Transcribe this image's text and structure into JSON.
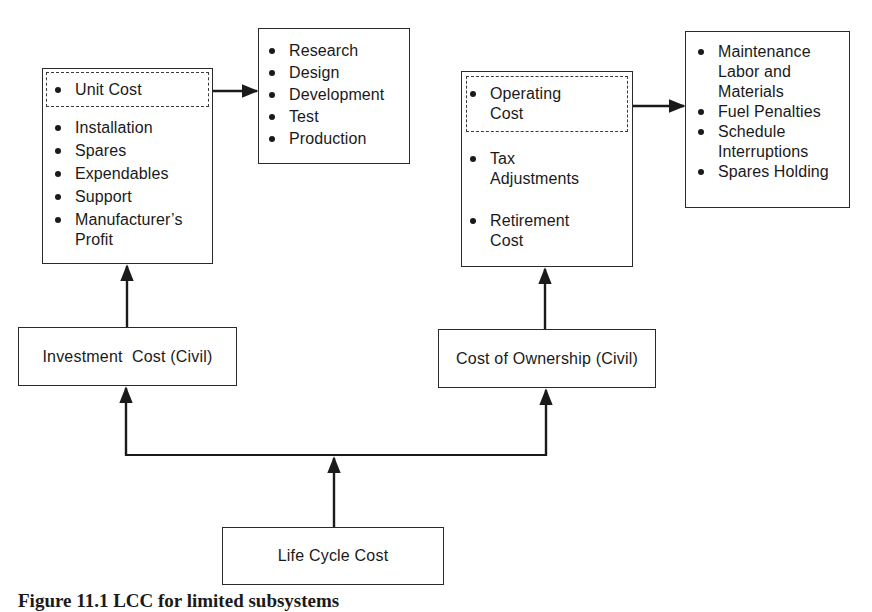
{
  "diagram": {
    "unit_box": {
      "highlighted_item": "Unit Cost",
      "items": [
        "Installation",
        "Spares",
        "Expendables",
        "Support",
        "Manufacturer’s\nProfit"
      ]
    },
    "rdte_box": {
      "items": [
        "Research",
        "Design",
        "Development",
        "Test",
        "Production"
      ]
    },
    "ownership_detail_box": {
      "highlighted_item": "Operating\nCost",
      "items": [
        "Tax\nAdjustments",
        "Retirement\nCost"
      ]
    },
    "operating_detail_box": {
      "items": [
        "Maintenance\nLabor  and\nMaterials",
        "Fuel Penalties",
        "Schedule\nInterruptions",
        "Spares Holding"
      ]
    },
    "investment_cost": {
      "label": "Investment  Cost (Civil)"
    },
    "cost_of_ownership": {
      "label": "Cost of Ownership (Civil)"
    },
    "life_cycle_cost": {
      "label": "Life Cycle Cost"
    },
    "edges": [
      {
        "from": "Life Cycle Cost",
        "to": "Investment  Cost (Civil)"
      },
      {
        "from": "Life Cycle Cost",
        "to": "Cost of Ownership (Civil)"
      },
      {
        "from": "Investment  Cost (Civil)",
        "to": "Unit Cost box"
      },
      {
        "from": "Cost of Ownership (Civil)",
        "to": "Operating Cost box"
      },
      {
        "from": "Unit Cost",
        "to": "Research / Design / Development / Test / Production"
      },
      {
        "from": "Operating Cost",
        "to": "Maintenance / Fuel / Schedule / Spares Holding"
      }
    ]
  },
  "caption": "Figure 11.1  LCC for limited subsystems"
}
